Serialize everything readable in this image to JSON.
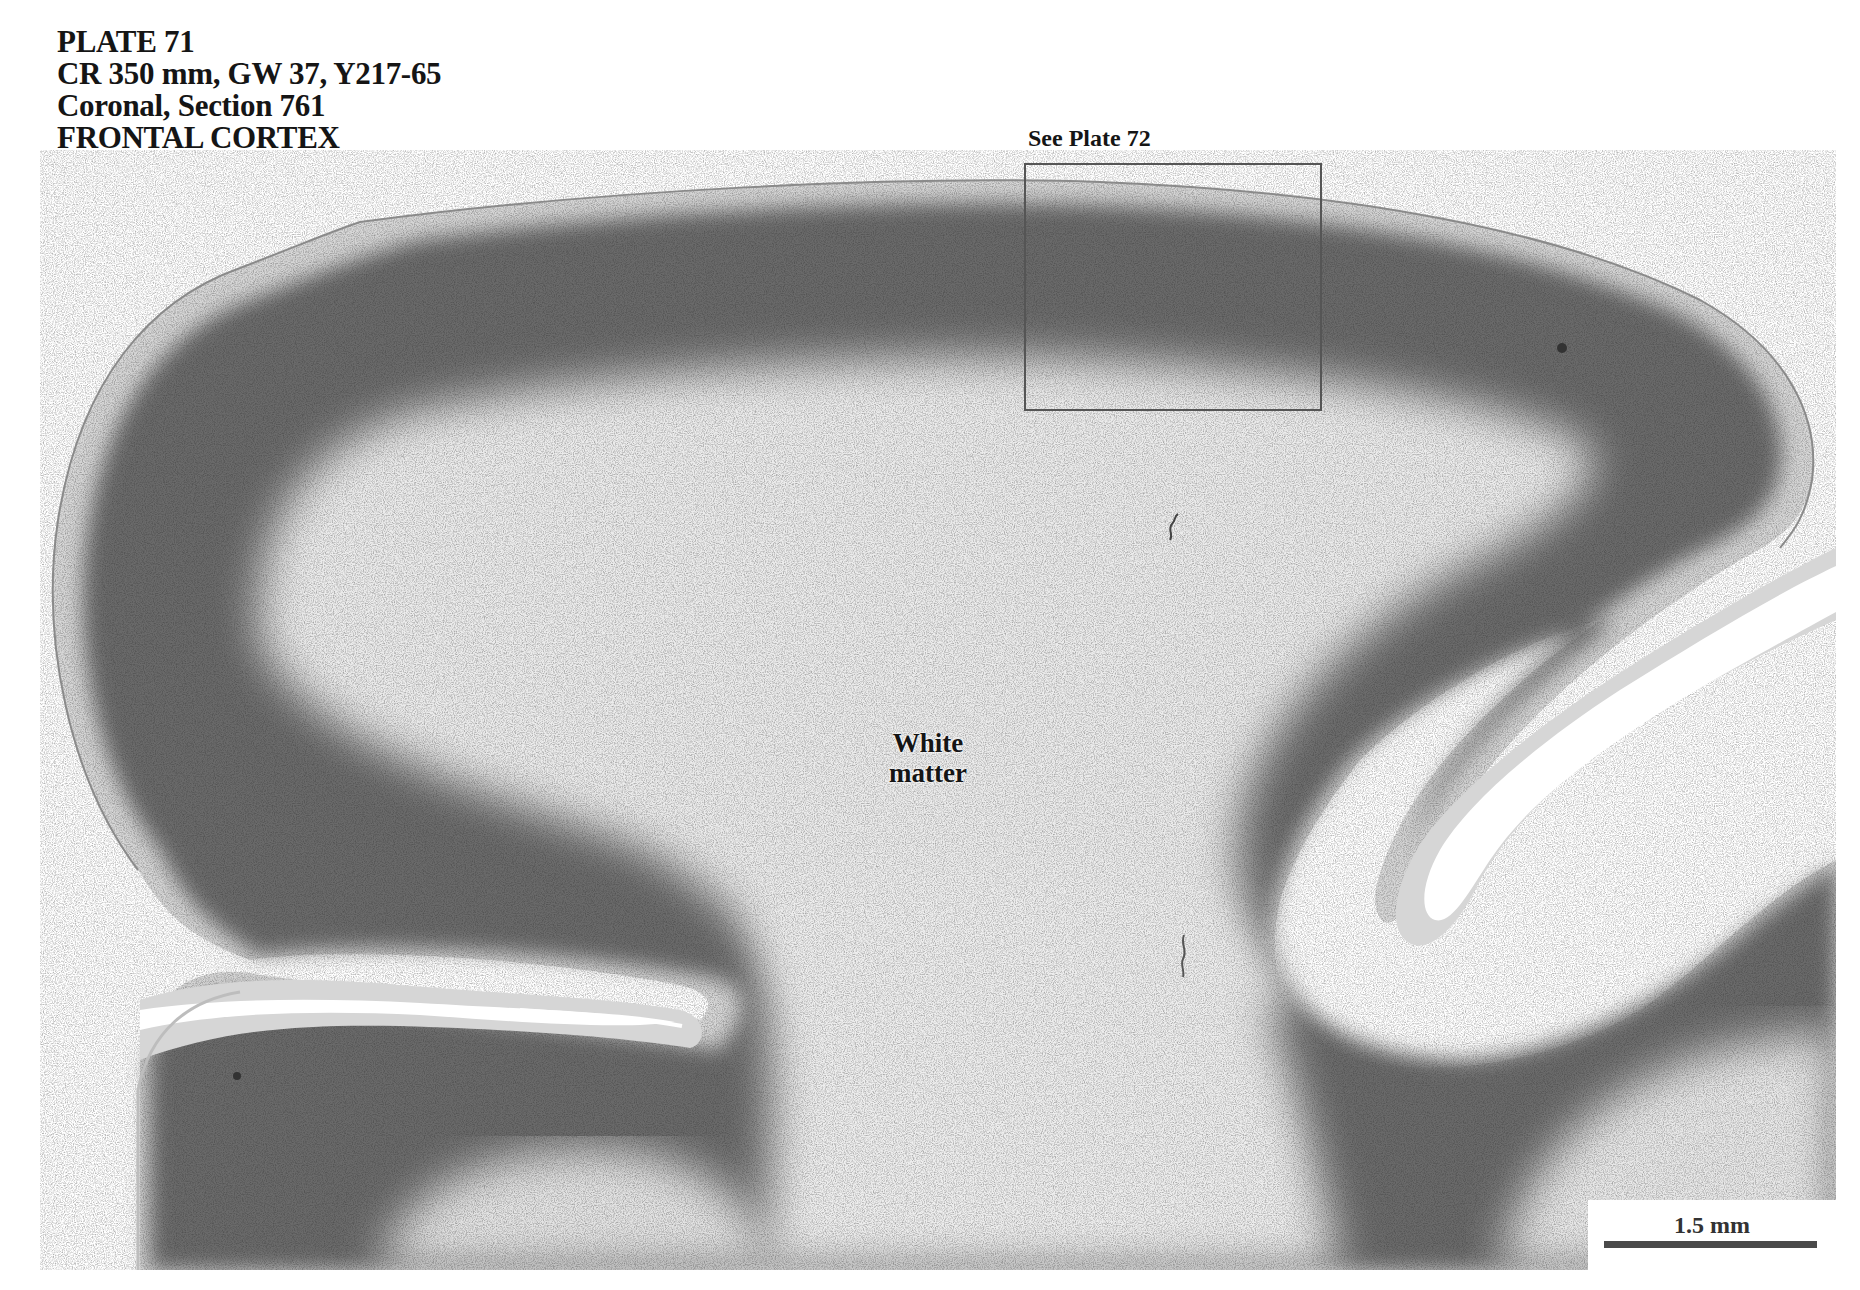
{
  "plate": {
    "title": "PLATE 71",
    "specimen": "CR 350 mm, GW 37, Y217-65",
    "section": "Coronal, Section 761",
    "region": "FRONTAL CORTEX"
  },
  "figure": {
    "inset": {
      "label": "See Plate 72"
    },
    "labels": {
      "white_matter_line1": "White",
      "white_matter_line2": "matter"
    },
    "scale_bar": {
      "label": "1.5 mm"
    },
    "colors": {
      "background": "#ffffff",
      "cortex_dark": "#3c3c3c",
      "cortex_mid": "#6e6e6e",
      "white_matter": "#e6e6e6",
      "pia": "#d2d2d2",
      "text": "#151515",
      "inset_border": "#555555"
    }
  }
}
